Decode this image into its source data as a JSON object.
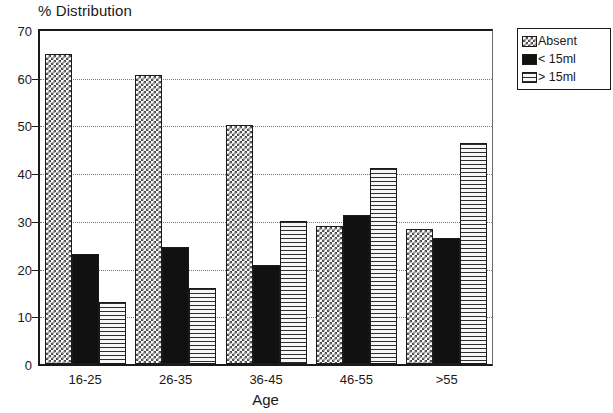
{
  "chart_data": {
    "type": "bar",
    "title": "% Distribution",
    "xlabel": "Age",
    "ylabel": "",
    "categories": [
      "16-25",
      "26-35",
      "36-45",
      "46-55",
      ">55"
    ],
    "series": [
      {
        "name": "Absent",
        "pattern": "checker",
        "values": [
          65,
          60.5,
          50,
          29,
          28.3
        ]
      },
      {
        "name": "< 15ml",
        "pattern": "solid",
        "values": [
          23,
          24.5,
          20.8,
          31.3,
          26.5
        ]
      },
      {
        "name": "> 15ml",
        "pattern": "hlines",
        "values": [
          13,
          16,
          30,
          41,
          46.3
        ]
      }
    ],
    "ylim": [
      0,
      70
    ],
    "yticks": [
      0,
      10,
      20,
      30,
      40,
      50,
      60,
      70
    ],
    "ytick_labels": [
      "0",
      "10",
      "20",
      "30",
      "40",
      "50",
      "60",
      "70"
    ],
    "grid": true,
    "grid_axis": "y",
    "legend_position": "top-right",
    "colors": {
      "axis": "#1a1a1a",
      "grid": "#7a7a7a",
      "solid_fill": "#111111",
      "background": "#ffffff"
    }
  }
}
